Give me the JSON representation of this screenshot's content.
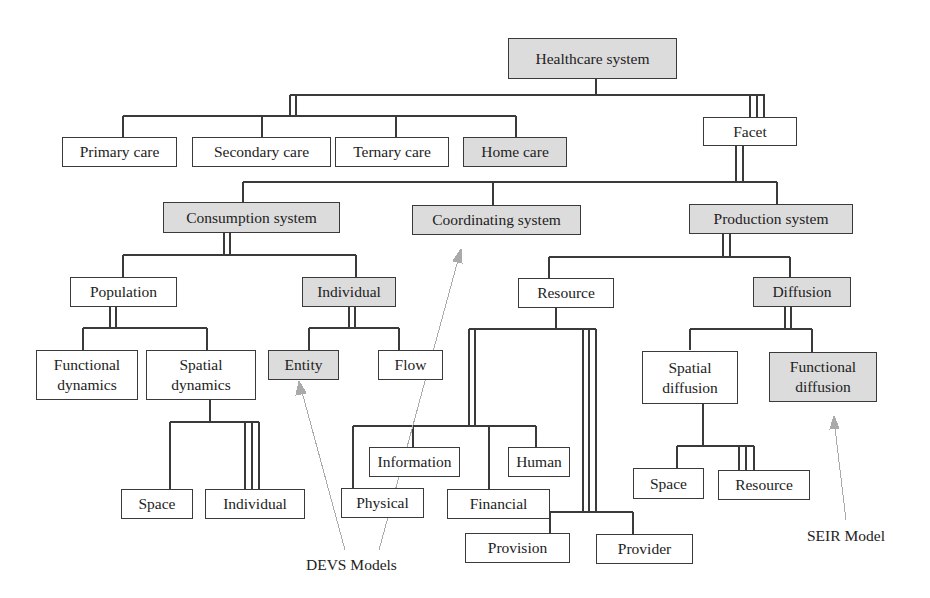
{
  "diagram": {
    "title": "Healthcare system",
    "colors": {
      "shaded_fill": "#dcdcdc",
      "plain_fill": "#ffffff",
      "stroke": "#3a3a3a",
      "annotation_arrow": "#aaaaaa"
    },
    "nodes": {
      "healthcare_system": {
        "label": "Healthcare system",
        "shaded": true
      },
      "primary_care": {
        "label": "Primary care",
        "shaded": false
      },
      "secondary_care": {
        "label": "Secondary care",
        "shaded": false
      },
      "ternary_care": {
        "label": "Ternary care",
        "shaded": false
      },
      "home_care": {
        "label": "Home care",
        "shaded": true
      },
      "facet": {
        "label": "Facet",
        "shaded": false
      },
      "consumption_system": {
        "label": "Consumption system",
        "shaded": true
      },
      "coordinating_system": {
        "label": "Coordinating system",
        "shaded": true
      },
      "production_system": {
        "label": "Production system",
        "shaded": true
      },
      "population": {
        "label": "Population",
        "shaded": false
      },
      "individual_consumption": {
        "label": "Individual",
        "shaded": true
      },
      "resource": {
        "label": "Resource",
        "shaded": false
      },
      "diffusion": {
        "label": "Diffusion",
        "shaded": true
      },
      "functional_dynamics": {
        "label": "Functional\ndynamics",
        "shaded": false
      },
      "spatial_dynamics": {
        "label": "Spatial\ndynamics",
        "shaded": false
      },
      "entity": {
        "label": "Entity",
        "shaded": true
      },
      "flow": {
        "label": "Flow",
        "shaded": false
      },
      "spatial_diffusion": {
        "label": "Spatial\ndiffusion",
        "shaded": false
      },
      "functional_diffusion": {
        "label": "Functional\ndiffusion",
        "shaded": true
      },
      "information": {
        "label": "Information",
        "shaded": false
      },
      "human": {
        "label": "Human",
        "shaded": false
      },
      "physical": {
        "label": "Physical",
        "shaded": false
      },
      "financial": {
        "label": "Financial",
        "shaded": false
      },
      "space_dynamics": {
        "label": "Space",
        "shaded": false
      },
      "individual_dynamics": {
        "label": "Individual",
        "shaded": false
      },
      "space_diffusion": {
        "label": "Space",
        "shaded": false
      },
      "resource_diffusion": {
        "label": "Resource",
        "shaded": false
      },
      "provision": {
        "label": "Provision",
        "shaded": false
      },
      "provider": {
        "label": "Provider",
        "shaded": false
      }
    },
    "annotations": {
      "devs_models": {
        "label": "DEVS Models",
        "points_to": [
          "Entity",
          "Coordinating system"
        ]
      },
      "seir_model": {
        "label": "SEIR Model",
        "points_to": [
          "Functional diffusion"
        ]
      }
    }
  }
}
